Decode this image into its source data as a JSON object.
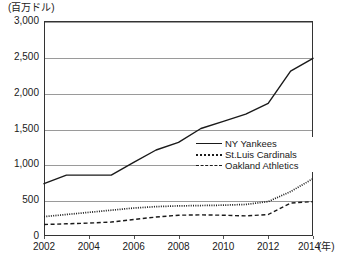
{
  "chart_data": {
    "type": "line",
    "title": "",
    "unit_label": "(百万ドル)",
    "xlabel": "(年)",
    "ylabel": "",
    "ylim": [
      0,
      3000
    ],
    "xlim": [
      2002,
      2014
    ],
    "grid": true,
    "legend_position": "inside-right-middle",
    "ytick_labels": [
      "3,000",
      "2,500",
      "2,000",
      "1,500",
      "1,000",
      "500",
      "0"
    ],
    "ytick_values": [
      3000,
      2500,
      2000,
      1500,
      1000,
      500,
      0
    ],
    "xtick_labels": [
      "2002",
      "2004",
      "2006",
      "2008",
      "2010",
      "2012",
      "2014"
    ],
    "xtick_values": [
      2002,
      2004,
      2006,
      2008,
      2010,
      2012,
      2014
    ],
    "x": [
      2002,
      2003,
      2004,
      2005,
      2006,
      2007,
      2008,
      2009,
      2010,
      2011,
      2012,
      2013,
      2014
    ],
    "series": [
      {
        "name": "NY Yankees",
        "style": "solid",
        "color": "#1a1a1a",
        "values": [
          730,
          850,
          850,
          850,
          1026,
          1200,
          1306,
          1500,
          1600,
          1700,
          1850,
          2300,
          2480
        ]
      },
      {
        "name": "St.Luis Cardinals",
        "style": "dotted",
        "color": "#1a1a1a",
        "values": [
          270,
          300,
          330,
          360,
          390,
          410,
          420,
          425,
          430,
          440,
          480,
          620,
          800
        ]
      },
      {
        "name": "Oakland Athletics",
        "style": "dashed",
        "color": "#1a1a1a",
        "values": [
          160,
          170,
          180,
          195,
          230,
          265,
          290,
          295,
          290,
          280,
          300,
          460,
          480
        ]
      }
    ]
  }
}
